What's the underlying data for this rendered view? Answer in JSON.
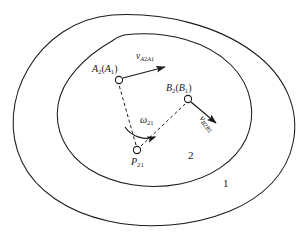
{
  "figure": {
    "stroke_color": "#1b1b1b",
    "background_color": "#ffffff",
    "labels": {
      "point_a": {
        "base": "A",
        "sub": "2",
        "paren_base": "A",
        "paren_sub": "1",
        "text": "A2(A1)"
      },
      "point_b": {
        "base": "B",
        "sub": "2",
        "paren_base": "B",
        "paren_sub": "1",
        "text": "B2(B1)"
      },
      "point_p": {
        "base": "P",
        "sub": "21",
        "text": "P21"
      },
      "vector_a": {
        "base": "v",
        "sub": "A2A1",
        "text": "vA2A1"
      },
      "vector_b": {
        "base": "v",
        "sub": "B2B1",
        "text": "vB2B1"
      },
      "omega": {
        "base": "ω",
        "sub": "21",
        "text": "ω21"
      },
      "body_outer": "1",
      "body_inner": "2"
    },
    "markers": {
      "point_a_label": "A2(A1) joint marker",
      "point_b_label": "B2(B1) joint marker",
      "point_p_label": "P21 instant centre marker"
    }
  }
}
